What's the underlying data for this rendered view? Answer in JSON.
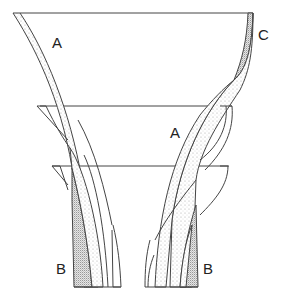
{
  "diagram": {
    "labels": {
      "a_left": "A",
      "a_right": "A",
      "b_left": "B",
      "b_right": "B",
      "c": "C"
    },
    "colors": {
      "line": "#444444",
      "light_stipple": "#e6e6e6",
      "dark_stipple": "#cfcfcf",
      "background": "#ffffff"
    }
  }
}
